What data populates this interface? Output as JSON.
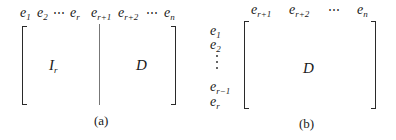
{
  "panel_a": {
    "column_labels_left": [
      {
        "base": "e",
        "sub": "1"
      },
      {
        "base": "e",
        "sub": "2"
      },
      {
        "base": "⋯",
        "sub": ""
      },
      {
        "base": "e",
        "sub": "r"
      }
    ],
    "column_labels_right": [
      {
        "base": "e",
        "sub": "r+1"
      },
      {
        "base": "e",
        "sub": "r+2"
      },
      {
        "base": "⋯",
        "sub": ""
      },
      {
        "base": "e",
        "sub": "n"
      }
    ],
    "left_block": {
      "base": "I",
      "sub": "r"
    },
    "right_block": {
      "base": "D"
    },
    "caption": "(a)"
  },
  "panel_b": {
    "column_labels": [
      {
        "base": "e",
        "sub": "r+1"
      },
      {
        "base": "e",
        "sub": "r+2"
      },
      {
        "base": "⋯",
        "sub": ""
      },
      {
        "base": "e",
        "sub": "n"
      }
    ],
    "row_labels": [
      {
        "base": "e",
        "sub": "1"
      },
      {
        "base": "e",
        "sub": "2"
      },
      {
        "base": "⋮",
        "sub": ""
      },
      {
        "base": "e",
        "sub": "r−1"
      },
      {
        "base": "e",
        "sub": "r"
      }
    ],
    "block": {
      "base": "D"
    },
    "caption": "(b)"
  }
}
